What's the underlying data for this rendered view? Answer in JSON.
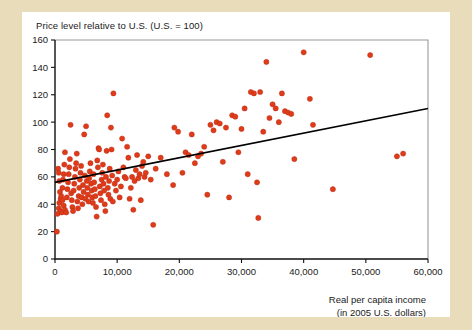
{
  "figure": {
    "title": "Price level relative to U.S. (U.S. = 100)",
    "xlabel_line1": "Real per capita income",
    "xlabel_line2": "(in 2005 U.S. dollars)",
    "background_color": "#e8dcba",
    "card_color": "#ffffff",
    "point_color": "#e03b18",
    "line_color": "#000000"
  },
  "chart_data": {
    "type": "scatter",
    "title": "Price level relative to U.S. (U.S. = 100)",
    "xlabel": "Real per capita income (in 2005 U.S. dollars)",
    "ylabel": "Price level relative to U.S. (U.S. = 100)",
    "xlim": [
      0,
      60000
    ],
    "ylim": [
      0,
      160
    ],
    "xticks": [
      0,
      10000,
      20000,
      30000,
      40000,
      50000,
      60000
    ],
    "xtick_labels": [
      "0",
      "10,000",
      "20,000",
      "30,000",
      "40,000",
      "50,000",
      "60,000"
    ],
    "yticks": [
      0,
      20,
      40,
      60,
      80,
      100,
      120,
      140,
      160
    ],
    "ytick_labels": [
      "0",
      "20",
      "40",
      "60",
      "80",
      "100",
      "120",
      "140",
      "160"
    ],
    "grid": false,
    "legend": null,
    "trend_line": {
      "x": [
        0,
        60000
      ],
      "y": [
        56,
        110
      ],
      "intercept": 56,
      "slope_per_10000": 9.0
    },
    "points": [
      [
        300,
        20
      ],
      [
        500,
        66
      ],
      [
        600,
        63
      ],
      [
        700,
        57
      ],
      [
        800,
        49
      ],
      [
        900,
        44
      ],
      [
        400,
        33
      ],
      [
        600,
        37
      ],
      [
        900,
        35
      ],
      [
        1100,
        34
      ],
      [
        700,
        41
      ],
      [
        1000,
        46
      ],
      [
        1200,
        52
      ],
      [
        1300,
        58
      ],
      [
        1400,
        62
      ],
      [
        1500,
        69
      ],
      [
        1600,
        78
      ],
      [
        1200,
        43
      ],
      [
        1400,
        39
      ],
      [
        1600,
        36
      ],
      [
        1800,
        34
      ],
      [
        1900,
        45
      ],
      [
        2000,
        51
      ],
      [
        2100,
        56
      ],
      [
        2200,
        62
      ],
      [
        2300,
        67
      ],
      [
        2400,
        73
      ],
      [
        2500,
        98
      ],
      [
        2600,
        48
      ],
      [
        2700,
        43
      ],
      [
        2800,
        38
      ],
      [
        2900,
        35
      ],
      [
        3000,
        50
      ],
      [
        3100,
        55
      ],
      [
        3200,
        60
      ],
      [
        3300,
        66
      ],
      [
        3400,
        70
      ],
      [
        3500,
        77
      ],
      [
        3600,
        42
      ],
      [
        3700,
        37
      ],
      [
        3800,
        46
      ],
      [
        3900,
        52
      ],
      [
        4000,
        58
      ],
      [
        4100,
        63
      ],
      [
        4200,
        68
      ],
      [
        4300,
        45
      ],
      [
        4400,
        40
      ],
      [
        4500,
        54
      ],
      [
        4600,
        49
      ],
      [
        4700,
        91
      ],
      [
        4800,
        61
      ],
      [
        4900,
        44
      ],
      [
        5000,
        97
      ],
      [
        5100,
        57
      ],
      [
        5200,
        52
      ],
      [
        5300,
        47
      ],
      [
        5400,
        42
      ],
      [
        5500,
        59
      ],
      [
        5600,
        64
      ],
      [
        5700,
        70
      ],
      [
        5800,
        55
      ],
      [
        5900,
        50
      ],
      [
        6000,
        45
      ],
      [
        6100,
        41
      ],
      [
        6200,
        62
      ],
      [
        6300,
        56
      ],
      [
        6400,
        51
      ],
      [
        6500,
        46
      ],
      [
        6600,
        38
      ],
      [
        6700,
        31
      ],
      [
        6800,
        72
      ],
      [
        6900,
        67
      ],
      [
        7000,
        81
      ],
      [
        7100,
        80
      ],
      [
        7200,
        53
      ],
      [
        7300,
        48
      ],
      [
        7400,
        43
      ],
      [
        7500,
        58
      ],
      [
        7600,
        63
      ],
      [
        7700,
        69
      ],
      [
        7800,
        55
      ],
      [
        7900,
        50
      ],
      [
        8000,
        40
      ],
      [
        8100,
        35
      ],
      [
        8200,
        60
      ],
      [
        8300,
        79
      ],
      [
        8400,
        105
      ],
      [
        8500,
        52
      ],
      [
        8600,
        47
      ],
      [
        8700,
        57
      ],
      [
        8800,
        66
      ],
      [
        8900,
        44
      ],
      [
        9000,
        96
      ],
      [
        9100,
        80
      ],
      [
        9200,
        61
      ],
      [
        9300,
        42
      ],
      [
        9400,
        121
      ],
      [
        9600,
        55
      ],
      [
        9800,
        50
      ],
      [
        10000,
        58
      ],
      [
        10200,
        64
      ],
      [
        10400,
        45
      ],
      [
        10600,
        53
      ],
      [
        10800,
        88
      ],
      [
        11000,
        67
      ],
      [
        11200,
        60
      ],
      [
        11400,
        59
      ],
      [
        11600,
        82
      ],
      [
        11800,
        74
      ],
      [
        12000,
        44
      ],
      [
        12200,
        52
      ],
      [
        12400,
        60
      ],
      [
        12600,
        36
      ],
      [
        12800,
        57
      ],
      [
        13000,
        65
      ],
      [
        13200,
        76
      ],
      [
        13400,
        59
      ],
      [
        13600,
        62
      ],
      [
        13800,
        43
      ],
      [
        14000,
        68
      ],
      [
        14200,
        71
      ],
      [
        14400,
        60
      ],
      [
        14600,
        63
      ],
      [
        15000,
        75
      ],
      [
        15400,
        58
      ],
      [
        15800,
        25
      ],
      [
        16200,
        66
      ],
      [
        17000,
        74
      ],
      [
        18000,
        62
      ],
      [
        19000,
        54
      ],
      [
        19200,
        96
      ],
      [
        19800,
        93
      ],
      [
        20500,
        63
      ],
      [
        21000,
        78
      ],
      [
        21500,
        76
      ],
      [
        22000,
        91
      ],
      [
        22500,
        70
      ],
      [
        23000,
        75
      ],
      [
        23500,
        77
      ],
      [
        24000,
        82
      ],
      [
        24500,
        47
      ],
      [
        25000,
        98
      ],
      [
        25500,
        94
      ],
      [
        26000,
        100
      ],
      [
        26500,
        99
      ],
      [
        27000,
        71
      ],
      [
        27500,
        96
      ],
      [
        28000,
        45
      ],
      [
        28500,
        105
      ],
      [
        29000,
        104
      ],
      [
        29500,
        78
      ],
      [
        30000,
        95
      ],
      [
        30500,
        110
      ],
      [
        31000,
        62
      ],
      [
        31500,
        122
      ],
      [
        32000,
        121
      ],
      [
        32500,
        56
      ],
      [
        32700,
        30
      ],
      [
        33000,
        122
      ],
      [
        33500,
        93
      ],
      [
        34000,
        144
      ],
      [
        34500,
        103
      ],
      [
        35000,
        113
      ],
      [
        35500,
        110
      ],
      [
        36000,
        100
      ],
      [
        36500,
        121
      ],
      [
        37000,
        108
      ],
      [
        37500,
        107
      ],
      [
        38000,
        106
      ],
      [
        38500,
        73
      ],
      [
        40000,
        151
      ],
      [
        41000,
        117
      ],
      [
        41500,
        98
      ],
      [
        44700,
        51
      ],
      [
        50700,
        149
      ],
      [
        55000,
        75
      ],
      [
        56000,
        77
      ]
    ]
  }
}
